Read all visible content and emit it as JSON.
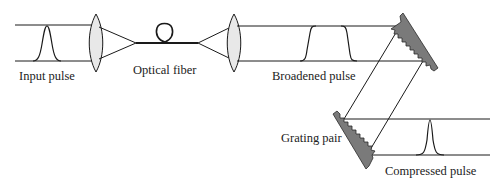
{
  "diagram": {
    "type": "optical pulse compression setup",
    "labels": {
      "input_pulse": "Input pulse",
      "optical_fiber": "Optical fiber",
      "broadened_pulse": "Broadened pulse",
      "grating_pair": "Grating pair",
      "compressed_pulse": "Compressed pulse"
    },
    "components": [
      {
        "id": "input-pulse",
        "kind": "pulse",
        "shape": "gaussian"
      },
      {
        "id": "lens-1",
        "kind": "lens"
      },
      {
        "id": "optical-fiber",
        "kind": "fiber",
        "has_loop": true
      },
      {
        "id": "lens-2",
        "kind": "lens"
      },
      {
        "id": "broadened-pulse",
        "kind": "pulse",
        "shape": "flat-top"
      },
      {
        "id": "grating-1",
        "kind": "grating"
      },
      {
        "id": "grating-2",
        "kind": "grating"
      },
      {
        "id": "compressed-pulse",
        "kind": "pulse",
        "shape": "narrow"
      }
    ],
    "colors": {
      "stroke": "#1a1a1a",
      "lens_fill": "#e8e8e8",
      "grating_fill": "#7a7a7a"
    }
  }
}
